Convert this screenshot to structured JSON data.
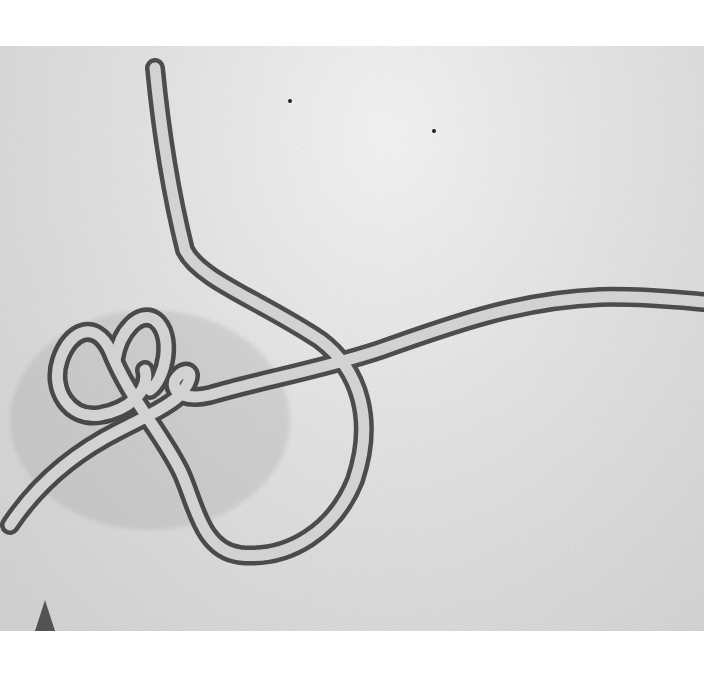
{
  "image": {
    "subject": "electron micrograph of filamentous virus particle",
    "description": "Grayscale transmission electron micrograph showing a long filamentous virion with a looped 'shepherd's crook' knot at left, on a mottled gray background",
    "colors": {
      "margin": "#ffffff",
      "background_light": "#f0f0f0",
      "background_mid": "#d8d8d8",
      "filament_core": "#cfcfcf",
      "filament_outline": "#3a3a3a"
    }
  }
}
